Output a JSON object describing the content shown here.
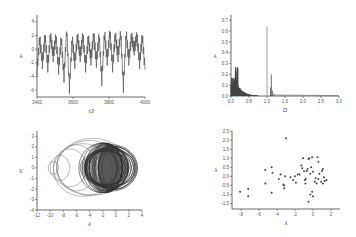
{
  "chart_data": [
    {
      "id": "time-series",
      "type": "line",
      "title": "",
      "xlabel": "τ3",
      "ylabel": "λ",
      "xlim": [
        3400,
        4000
      ],
      "ylim": [
        -7,
        5
      ],
      "xticks": [
        "3400",
        "3600",
        "3800",
        "4000"
      ],
      "yticks": [
        "-6",
        "-4",
        "-2",
        "0",
        "2",
        "4"
      ],
      "grid": false,
      "description": "Chaotic oscillation of λ vs time, mostly between -3 and 2 with dips to about -5.8",
      "x": [
        3400,
        3415,
        3430,
        3445,
        3460,
        3475,
        3490,
        3505,
        3520,
        3535,
        3550,
        3565,
        3580,
        3595,
        3610,
        3625,
        3640,
        3655,
        3670,
        3685,
        3700,
        3715,
        3730,
        3745,
        3760,
        3775,
        3790,
        3805,
        3820,
        3835,
        3850,
        3865,
        3880,
        3895,
        3910,
        3925,
        3940,
        3955,
        3970,
        3985,
        4000
      ],
      "values": [
        -3,
        1.5,
        -2,
        1.8,
        -2.5,
        1.9,
        -1,
        1.7,
        -2.8,
        1.5,
        -4,
        2.8,
        -5.8,
        1.5,
        -2,
        1.8,
        -1,
        1.9,
        -2.5,
        1.6,
        -1.5,
        2,
        -1.8,
        1.9,
        -4.5,
        2.2,
        -1.5,
        2.4,
        -2.5,
        2,
        -1,
        2.3,
        -5.5,
        2.3,
        -1.5,
        1.8,
        0,
        1.9,
        -2,
        1.8,
        -3
      ]
    },
    {
      "id": "spectrum",
      "type": "bar",
      "title": "",
      "xlabel": "Ω",
      "ylabel": "λ",
      "xlim": [
        0,
        3.0
      ],
      "ylim": [
        0,
        0.75
      ],
      "xticks": [
        "0.0",
        "0.5",
        "1.0",
        "1.5",
        "2.0",
        "2.5",
        "3.0"
      ],
      "yticks": [
        "0.0",
        "0.1",
        "0.2",
        "0.3",
        "0.4",
        "0.5",
        "0.6",
        "0.7"
      ],
      "grid": false,
      "description": "Power spectrum with broadband content below 0.5, sharp peak at 1.0 (~0.65) and secondary peak at ~1.12 (~0.2)",
      "x": [
        0.02,
        0.05,
        0.08,
        0.1,
        0.13,
        0.15,
        0.18,
        0.2,
        0.25,
        0.3,
        0.35,
        0.4,
        0.5,
        0.6,
        0.7,
        1.0,
        1.1,
        1.12,
        1.15,
        1.2,
        1.4,
        2.0,
        2.5,
        3.0
      ],
      "values": [
        0.17,
        0.15,
        0.12,
        0.1,
        0.2,
        0.3,
        0.25,
        0.12,
        0.08,
        0.05,
        0.04,
        0.03,
        0.02,
        0.01,
        0.005,
        0.65,
        0.08,
        0.2,
        0.05,
        0.02,
        0.005,
        0.002,
        0.001,
        0.0
      ]
    },
    {
      "id": "phase-portrait",
      "type": "line",
      "title": "",
      "xlabel": "λ",
      "ylabel": "λ'",
      "xlim": [
        -12,
        4
      ],
      "ylim": [
        -4,
        3.5
      ],
      "xticks": [
        "-12",
        "-10",
        "-8",
        "-6",
        "-4",
        "-2",
        "0",
        "2",
        "4"
      ],
      "yticks": [
        "-4",
        "-3",
        "-2",
        "-1",
        "0",
        "1",
        "2",
        "3"
      ],
      "grid": false,
      "description": "Phase-space attractor: dense filled region between λ≈-4 and 2, with outer loops extending left to about -10"
    },
    {
      "id": "return-map",
      "type": "scatter",
      "title": "",
      "xlabel": "λ",
      "ylabel": "λ",
      "xlim": [
        -9,
        3
      ],
      "ylim": [
        -1.8,
        2.5
      ],
      "xticks": [
        "-8",
        "-6",
        "-4",
        "-2",
        "0",
        "2"
      ],
      "yticks": [
        "-1.5",
        "-1.0",
        "-0.5",
        "0.0",
        "0.5",
        "1.0",
        "1.5",
        "2.0",
        "2.5"
      ],
      "grid": false,
      "points": [
        [
          -8.1,
          -0.85
        ],
        [
          -7.2,
          -0.7
        ],
        [
          -7.2,
          -1.1
        ],
        [
          -5.3,
          0.35
        ],
        [
          -5.3,
          -0.4
        ],
        [
          -4.6,
          0.5
        ],
        [
          -4.5,
          0.2
        ],
        [
          -4.6,
          -0.9
        ],
        [
          -3.8,
          -0.15
        ],
        [
          -3.6,
          0.1
        ],
        [
          -3.3,
          -0.45
        ],
        [
          -3.2,
          -0.65
        ],
        [
          -3.1,
          0
        ],
        [
          -3.0,
          2.1
        ],
        [
          -3.2,
          -0.5
        ],
        [
          -2.5,
          -0.05
        ],
        [
          -2.2,
          -0.2
        ],
        [
          -2.0,
          0
        ],
        [
          -1.9,
          -0.35
        ],
        [
          -1.7,
          0.1
        ],
        [
          -1.5,
          0.1
        ],
        [
          -1.3,
          0.6
        ],
        [
          -1.2,
          0.45
        ],
        [
          -1.1,
          1.0
        ],
        [
          -1.0,
          0.3
        ],
        [
          -0.9,
          -0.2
        ],
        [
          -0.85,
          -0.4
        ],
        [
          -0.8,
          -0.15
        ],
        [
          -0.7,
          0.3
        ],
        [
          -0.6,
          0.4
        ],
        [
          -0.5,
          0.95
        ],
        [
          -0.4,
          1.0
        ],
        [
          -0.3,
          0.15
        ],
        [
          -0.2,
          0.5
        ],
        [
          -0.1,
          1.05
        ],
        [
          -0.1,
          -0.85
        ],
        [
          0.0,
          0.25
        ],
        [
          0.0,
          -1.1
        ],
        [
          -0.3,
          -1.0
        ],
        [
          -0.5,
          -1.4
        ],
        [
          0.2,
          -0.3
        ],
        [
          0.3,
          -0.1
        ],
        [
          0.4,
          -0.4
        ],
        [
          0.5,
          1.05
        ],
        [
          0.6,
          0.8
        ],
        [
          0.6,
          -0.15
        ],
        [
          0.7,
          0.15
        ],
        [
          0.9,
          -0.3
        ],
        [
          1.0,
          0.3
        ],
        [
          1.1,
          0.4
        ],
        [
          1.1,
          -0.4
        ],
        [
          1.2,
          -0.05
        ],
        [
          1.3,
          -0.25
        ],
        [
          1.5,
          -0.2
        ]
      ]
    }
  ]
}
